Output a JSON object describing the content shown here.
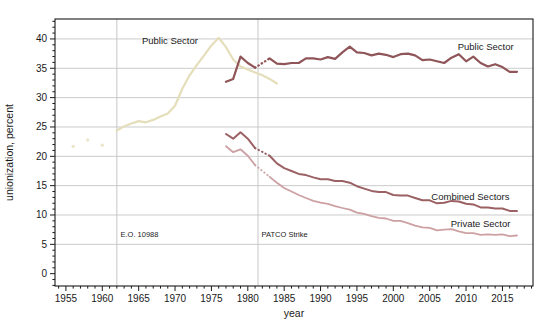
{
  "chart_data": {
    "type": "line",
    "title": "",
    "xlabel": "year",
    "ylabel": "unionization, percent",
    "xlim": [
      1953.5,
      2019.2
    ],
    "ylim": [
      -2.1,
      43.4
    ],
    "x_major_ticks": [
      1955,
      1960,
      1965,
      1970,
      1975,
      1980,
      1985,
      1990,
      1995,
      2000,
      2005,
      2010,
      2015
    ],
    "x_minor_step": 1,
    "y_major_ticks": [
      0,
      5,
      10,
      15,
      20,
      25,
      30,
      35,
      40
    ],
    "y_minor_step": 1,
    "grid_y": [
      5,
      10,
      15,
      20,
      25,
      30,
      35,
      40
    ],
    "grid_on": true,
    "legend": "none (direct line labels)",
    "colors": {
      "grid": "#cbcbcb",
      "event_line": "#c6c6c6",
      "frame": "#1a1a1a",
      "tick": "#1a1a1a",
      "text": "#1a1a1a",
      "old_public": "#e5deba",
      "public": "#8f5558",
      "combined": "#9b6164",
      "private": "#cda1a4"
    },
    "event_lines": [
      {
        "name": "eo-10988",
        "x": 1962,
        "label": "E.O. 10988",
        "label_x": 1962.5,
        "label_y": 6.3
      },
      {
        "name": "patco-strike",
        "x": 1981.4,
        "label": "PATCO Strike",
        "label_x": 1981.9,
        "label_y": 6.3
      }
    ],
    "series": [
      {
        "name": "public-sector-early-points",
        "type": "scatter",
        "color_key": "old_public",
        "points": [
          [
            1956,
            21.7
          ],
          [
            1958,
            22.8
          ],
          [
            1960,
            21.9
          ]
        ]
      },
      {
        "name": "public-sector-old",
        "type": "line",
        "color_key": "old_public",
        "width": 2.2,
        "label": {
          "text": "Public Sector",
          "x": 1969.3,
          "y": 39.6
        },
        "segments": [
          {
            "x_start": 1962,
            "values": [
              24.4,
              25.1,
              25.6,
              26.0,
              25.8,
              26.2,
              26.8,
              27.3,
              28.6,
              31.5,
              33.8,
              35.6,
              37.2,
              38.9,
              40.2,
              38.6,
              36.5,
              35.3,
              34.8,
              34.3,
              33.8,
              33.2,
              32.4
            ]
          }
        ]
      },
      {
        "name": "public-sector",
        "type": "line",
        "color_key": "public",
        "width": 2.2,
        "label": {
          "text": "Public Sector",
          "x": 2012.7,
          "y": 38.7
        },
        "segments": [
          {
            "x_start": 1977,
            "values": [
              32.7,
              33.2,
              37.0,
              35.9,
              35.1
            ]
          },
          {
            "x_start": 1983,
            "values": [
              36.7,
              35.8,
              35.7,
              35.9,
              35.9,
              36.7,
              36.7,
              36.5,
              36.9,
              36.6,
              37.7,
              38.7,
              37.7,
              37.6,
              37.2,
              37.5,
              37.3,
              36.9,
              37.4,
              37.5,
              37.2,
              36.4,
              36.5,
              36.2,
              35.9,
              36.8,
              37.4,
              36.2,
              37.0,
              35.9,
              35.3,
              35.7,
              35.2,
              34.4,
              34.4
            ]
          }
        ]
      },
      {
        "name": "combined-sectors",
        "type": "line",
        "color_key": "combined",
        "width": 2.0,
        "label": {
          "text": "Combined Sectors",
          "x": 2010.6,
          "y": 13.1
        },
        "segments": [
          {
            "x_start": 1977,
            "values": [
              23.8,
              23.0,
              24.1,
              23.0,
              21.4
            ]
          },
          {
            "x_start": 1983,
            "values": [
              20.1,
              18.8,
              18.0,
              17.5,
              17.0,
              16.8,
              16.4,
              16.1,
              16.1,
              15.8,
              15.8,
              15.5,
              14.9,
              14.5,
              14.1,
              13.9,
              13.9,
              13.4,
              13.3,
              13.3,
              12.9,
              12.5,
              12.5,
              12.0,
              12.1,
              12.4,
              12.3,
              11.9,
              11.8,
              11.3,
              11.3,
              11.1,
              11.1,
              10.7,
              10.7
            ]
          }
        ]
      },
      {
        "name": "private-sector",
        "type": "line",
        "color_key": "private",
        "width": 1.8,
        "label": {
          "text": "Private Sector",
          "x": 2012.0,
          "y": 8.5
        },
        "segments": [
          {
            "x_start": 1977,
            "values": [
              21.7,
              20.7,
              21.2,
              20.1,
              18.5
            ]
          },
          {
            "x_start": 1983,
            "values": [
              16.5,
              15.5,
              14.6,
              14.0,
              13.4,
              12.9,
              12.4,
              12.1,
              11.9,
              11.5,
              11.2,
              10.9,
              10.4,
              10.2,
              9.8,
              9.5,
              9.4,
              9.0,
              9.0,
              8.6,
              8.2,
              7.9,
              7.8,
              7.4,
              7.5,
              7.6,
              7.2,
              6.9,
              6.9,
              6.6,
              6.7,
              6.6,
              6.7,
              6.4,
              6.5
            ]
          }
        ]
      }
    ]
  }
}
